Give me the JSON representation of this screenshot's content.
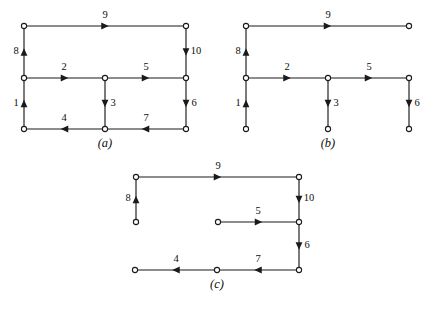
{
  "figure": {
    "width": 432,
    "height": 309,
    "background": "#ffffff",
    "ink_color": "#1a1a1a"
  },
  "panels": [
    {
      "id": "a",
      "caption": "(a)",
      "caption_x": 85,
      "caption_y": 136,
      "origin_x": 0,
      "origin_y": 0,
      "nodes": [
        {
          "id": "n_tl",
          "name": "top-left",
          "x": 24,
          "y": 26
        },
        {
          "id": "n_tr",
          "name": "top-right",
          "x": 186,
          "y": 26
        },
        {
          "id": "n_ml",
          "name": "middle-left",
          "x": 24,
          "y": 78
        },
        {
          "id": "n_mc",
          "name": "middle-center",
          "x": 105,
          "y": 78
        },
        {
          "id": "n_mr",
          "name": "middle-right",
          "x": 186,
          "y": 78
        },
        {
          "id": "n_bl",
          "name": "bottom-left",
          "x": 24,
          "y": 129
        },
        {
          "id": "n_bc",
          "name": "bottom-center",
          "x": 105,
          "y": 129
        },
        {
          "id": "n_br",
          "name": "bottom-right",
          "x": 186,
          "y": 129
        }
      ],
      "edges": [
        {
          "label": "1",
          "from": "n_bl",
          "to": "n_ml",
          "dir": "up",
          "label_x": 16,
          "label_y": 104
        },
        {
          "label": "2",
          "from": "n_ml",
          "to": "n_mc",
          "dir": "right",
          "label_x": 64,
          "label_y": 68
        },
        {
          "label": "3",
          "from": "n_mc",
          "to": "n_bc",
          "dir": "down",
          "label_x": 113,
          "label_y": 104
        },
        {
          "label": "4",
          "from": "n_bc",
          "to": "n_bl",
          "dir": "left",
          "label_x": 64,
          "label_y": 119
        },
        {
          "label": "5",
          "from": "n_mc",
          "to": "n_mr",
          "dir": "right",
          "label_x": 146,
          "label_y": 68
        },
        {
          "label": "6",
          "from": "n_mr",
          "to": "n_br",
          "dir": "down",
          "label_x": 194,
          "label_y": 104
        },
        {
          "label": "7",
          "from": "n_br",
          "to": "n_bc",
          "dir": "left",
          "label_x": 146,
          "label_y": 119
        },
        {
          "label": "8",
          "from": "n_ml",
          "to": "n_tl",
          "dir": "up",
          "label_x": 16,
          "label_y": 52
        },
        {
          "label": "9",
          "from": "n_tl",
          "to": "n_tr",
          "dir": "right",
          "label_x": 105,
          "label_y": 16
        },
        {
          "label": "10",
          "from": "n_tr",
          "to": "n_mr",
          "dir": "down",
          "label_x": 196,
          "label_y": 52
        }
      ]
    },
    {
      "id": "b",
      "caption": "(b)",
      "caption_x": 308,
      "caption_y": 136,
      "origin_x": 0,
      "origin_y": 0,
      "nodes": [
        {
          "id": "n_tl",
          "name": "top-left",
          "x": 246,
          "y": 26
        },
        {
          "id": "n_tr",
          "name": "top-right",
          "x": 409,
          "y": 26
        },
        {
          "id": "n_ml",
          "name": "middle-left",
          "x": 246,
          "y": 78
        },
        {
          "id": "n_mc",
          "name": "middle-center",
          "x": 328,
          "y": 78
        },
        {
          "id": "n_mr",
          "name": "middle-right",
          "x": 409,
          "y": 78
        },
        {
          "id": "n_bl",
          "name": "bottom-left",
          "x": 246,
          "y": 129
        },
        {
          "id": "n_bc",
          "name": "bottom-center",
          "x": 328,
          "y": 129
        },
        {
          "id": "n_br",
          "name": "bottom-right",
          "x": 409,
          "y": 129
        }
      ],
      "edges": [
        {
          "label": "1",
          "from": "n_bl",
          "to": "n_ml",
          "dir": "up",
          "label_x": 238,
          "label_y": 104
        },
        {
          "label": "2",
          "from": "n_ml",
          "to": "n_mc",
          "dir": "right",
          "label_x": 287,
          "label_y": 68
        },
        {
          "label": "3",
          "from": "n_mc",
          "to": "n_bc",
          "dir": "down",
          "label_x": 336,
          "label_y": 104
        },
        {
          "label": "5",
          "from": "n_mc",
          "to": "n_mr",
          "dir": "right",
          "label_x": 369,
          "label_y": 68
        },
        {
          "label": "6",
          "from": "n_mr",
          "to": "n_br",
          "dir": "down",
          "label_x": 417,
          "label_y": 104
        },
        {
          "label": "8",
          "from": "n_ml",
          "to": "n_tl",
          "dir": "up",
          "label_x": 238,
          "label_y": 52
        },
        {
          "label": "9",
          "from": "n_tl",
          "to": "n_tr",
          "dir": "right",
          "label_x": 328,
          "label_y": 16
        }
      ]
    },
    {
      "id": "c",
      "caption": "(c)",
      "caption_x": 197,
      "caption_y": 277,
      "origin_x": 0,
      "origin_y": 0,
      "nodes": [
        {
          "id": "n_tl",
          "name": "top-left",
          "x": 136,
          "y": 177
        },
        {
          "id": "n_tr",
          "name": "top-right",
          "x": 299,
          "y": 177
        },
        {
          "id": "n_ml",
          "name": "middle-left-stub",
          "x": 136,
          "y": 222
        },
        {
          "id": "n_mc",
          "name": "middle-center",
          "x": 218,
          "y": 222
        },
        {
          "id": "n_mr",
          "name": "middle-right",
          "x": 299,
          "y": 222
        },
        {
          "id": "n_bl",
          "name": "bottom-left",
          "x": 135,
          "y": 270
        },
        {
          "id": "n_bc",
          "name": "bottom-center",
          "x": 217,
          "y": 270
        },
        {
          "id": "n_br",
          "name": "bottom-right",
          "x": 299,
          "y": 270
        }
      ],
      "edges": [
        {
          "label": "4",
          "from": "n_bc",
          "to": "n_bl",
          "dir": "left",
          "label_x": 176,
          "label_y": 260
        },
        {
          "label": "5",
          "from": "n_mc",
          "to": "n_mr",
          "dir": "right",
          "label_x": 258,
          "label_y": 212
        },
        {
          "label": "6",
          "from": "n_mr",
          "to": "n_br",
          "dir": "down",
          "label_x": 307,
          "label_y": 246
        },
        {
          "label": "7",
          "from": "n_br",
          "to": "n_bc",
          "dir": "left",
          "label_x": 258,
          "label_y": 260
        },
        {
          "label": "8",
          "from": "n_ml",
          "to": "n_tl",
          "dir": "up",
          "label_x": 128,
          "label_y": 199
        },
        {
          "label": "9",
          "from": "n_tl",
          "to": "n_tr",
          "dir": "right",
          "label_x": 218,
          "label_y": 167
        },
        {
          "label": "10",
          "from": "n_tr",
          "to": "n_mr",
          "dir": "down",
          "label_x": 309,
          "label_y": 199
        }
      ]
    }
  ]
}
